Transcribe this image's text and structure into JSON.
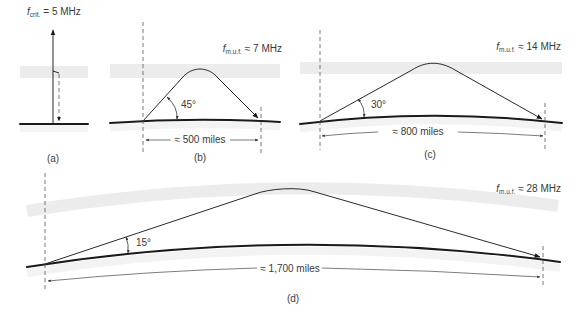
{
  "figure": {
    "panels": [
      {
        "id": "a",
        "caption": "(a)",
        "freq_label": {
          "symbol": "f",
          "subscript": "crit.",
          "rhs": "= 5 MHz"
        },
        "ray": "vertical incidence, reflected back down"
      },
      {
        "id": "b",
        "caption": "(b)",
        "freq_label": {
          "symbol": "f",
          "subscript": "m.u.f.",
          "rhs": "≈ 7 MHz"
        },
        "angle": "45°",
        "distance": "≈ 500 miles"
      },
      {
        "id": "c",
        "caption": "(c)",
        "freq_label": {
          "symbol": "f",
          "subscript": "m.u.f.",
          "rhs": "≈ 14 MHz"
        },
        "angle": "30°",
        "distance": "≈ 800 miles"
      },
      {
        "id": "d",
        "caption": "(d)",
        "freq_label": {
          "symbol": "f",
          "subscript": "m.u.f.",
          "rhs": "≈ 28 MHz"
        },
        "angle": "15°",
        "distance": "≈ 1,700 miles"
      }
    ],
    "colors": {
      "ionosphere_band": "#ececec",
      "ground_line": "#1a1a1a",
      "ray_line": "#2a2a2a",
      "text": "#3a3a3a"
    }
  }
}
